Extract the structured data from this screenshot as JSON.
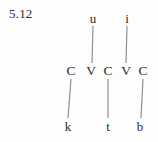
{
  "figure": {
    "example_number": "5.12",
    "caption": "",
    "background_color": "#fdfdfd",
    "text_color": "#2b2b2b",
    "line_color": "#8c8c8c"
  },
  "tiers": {
    "vowel_tier": {
      "name": "vowel-tier",
      "nodes": [
        {
          "label": "u",
          "x": 93,
          "y": 18
        },
        {
          "label": "i",
          "x": 127,
          "y": 18
        }
      ]
    },
    "skeleton_tier": {
      "name": "cv-skeleton-tier",
      "nodes": [
        {
          "label": "C",
          "x": 71,
          "y": 71
        },
        {
          "label": "V",
          "x": 91,
          "y": 71
        },
        {
          "label": "C",
          "x": 108,
          "y": 71
        },
        {
          "label": "V",
          "x": 126,
          "y": 71
        },
        {
          "label": "C",
          "x": 143,
          "y": 71
        }
      ]
    },
    "root_tier": {
      "name": "consonantal-root-tier",
      "nodes": [
        {
          "label": "k",
          "x": 68,
          "y": 126
        },
        {
          "label": "t",
          "x": 108,
          "y": 126
        },
        {
          "label": "b",
          "x": 140,
          "y": 126
        }
      ]
    }
  },
  "association_lines": [
    {
      "name": "u-to-v1",
      "x1": 93,
      "y1": 26,
      "x2": 92,
      "y2": 63
    },
    {
      "name": "i-to-v2",
      "x1": 127,
      "y1": 26,
      "x2": 126,
      "y2": 63
    },
    {
      "name": "c1-to-k",
      "x1": 71,
      "y1": 79,
      "x2": 68,
      "y2": 118
    },
    {
      "name": "c2-to-t",
      "x1": 108,
      "y1": 79,
      "x2": 108,
      "y2": 118
    },
    {
      "name": "c3-to-b",
      "x1": 143,
      "y1": 79,
      "x2": 141,
      "y2": 118
    }
  ]
}
